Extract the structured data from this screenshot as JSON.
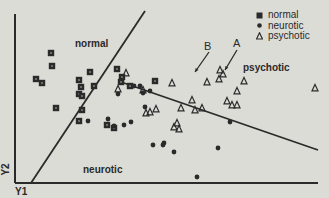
{
  "chart_data": {
    "type": "scatter",
    "title": "",
    "xlabel": "Y1",
    "ylabel": "Y2",
    "grid": false,
    "legend_position": "top-right",
    "legend": [
      {
        "label": "normal",
        "marker": "square"
      },
      {
        "label": "neurotic",
        "marker": "circle"
      },
      {
        "label": "psychotic",
        "marker": "triangle"
      }
    ],
    "region_labels": [
      {
        "text": "normal",
        "x": 75,
        "y": 45
      },
      {
        "text": "psychotic",
        "x": 243,
        "y": 69
      },
      {
        "text": "neurotic",
        "x": 83,
        "y": 171
      }
    ],
    "annotations": [
      {
        "text": "B",
        "x": 208,
        "y": 48
      },
      {
        "text": "A",
        "x": 237,
        "y": 45
      }
    ],
    "series": [
      {
        "name": "normal",
        "marker": "square",
        "points": [
          [
            51,
            53
          ],
          [
            52,
            66
          ],
          [
            36,
            79
          ],
          [
            42,
            83
          ],
          [
            90,
            72
          ],
          [
            79,
            80
          ],
          [
            81,
            87
          ],
          [
            94,
            86
          ],
          [
            79,
            94
          ],
          [
            82,
            96
          ],
          [
            56,
            108
          ],
          [
            82,
            110
          ],
          [
            79,
            121
          ],
          [
            117,
            69
          ],
          [
            121,
            82
          ],
          [
            130,
            86
          ],
          [
            155,
            81
          ],
          [
            122,
            77
          ],
          [
            107,
            125
          ],
          [
            114,
            128
          ]
        ]
      },
      {
        "name": "neurotic",
        "marker": "circle",
        "points": [
          [
            88,
            121
          ],
          [
            108,
            119
          ],
          [
            114,
            126
          ],
          [
            124,
            125
          ],
          [
            131,
            122
          ],
          [
            118,
            94
          ],
          [
            134,
            86
          ],
          [
            140,
            86
          ],
          [
            145,
            107
          ],
          [
            164,
            143
          ],
          [
            153,
            145
          ],
          [
            143,
            93
          ],
          [
            150,
            91
          ],
          [
            174,
            152
          ],
          [
            163,
            145
          ],
          [
            230,
            122
          ],
          [
            218,
            148
          ],
          [
            197,
            177
          ]
        ]
      },
      {
        "name": "psychotic",
        "marker": "triangle",
        "points": [
          [
            126,
            73
          ],
          [
            118,
            89
          ],
          [
            143,
            90
          ],
          [
            172,
            83
          ],
          [
            192,
            100
          ],
          [
            146,
            113
          ],
          [
            150,
            112
          ],
          [
            156,
            109
          ],
          [
            174,
            127
          ],
          [
            177,
            123
          ],
          [
            179,
            129
          ],
          [
            220,
            70
          ],
          [
            223,
            74
          ],
          [
            219,
            79
          ],
          [
            244,
            81
          ],
          [
            237,
            91
          ],
          [
            207,
            82
          ],
          [
            227,
            101
          ],
          [
            232,
            105
          ],
          [
            195,
            110
          ],
          [
            181,
            108
          ],
          [
            237,
            105
          ],
          [
            202,
            108
          ],
          [
            315,
            88
          ]
        ]
      }
    ],
    "lines": [
      {
        "name": "boundary-normal-neurotic",
        "from": [
          31,
          183
        ],
        "to": [
          145,
          11
        ]
      },
      {
        "name": "boundary-psychotic",
        "from": [
          121,
          82
        ],
        "to": [
          318,
          150
        ]
      }
    ],
    "arrows": [
      {
        "label": "B",
        "from": [
          209,
          52
        ],
        "to": [
          195,
          72
        ]
      },
      {
        "label": "A",
        "from": [
          237,
          50
        ],
        "to": [
          225,
          70
        ]
      }
    ]
  }
}
